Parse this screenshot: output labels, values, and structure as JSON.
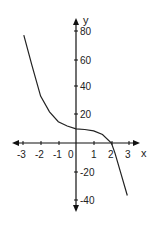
{
  "chart_data": {
    "type": "line",
    "title": "",
    "xlabel": "x",
    "ylabel": "y",
    "xlim": [
      -3.5,
      3.5
    ],
    "ylim": [
      -50,
      90
    ],
    "grid": false,
    "x_ticks": [
      "-3",
      "-2",
      "-1",
      "0",
      "1",
      "2",
      "3"
    ],
    "y_ticks": [
      "80",
      "60",
      "40",
      "20",
      "-20",
      "-40"
    ],
    "series": [
      {
        "name": "f(x)",
        "x": [
          -2.95,
          -2.5,
          -2.0,
          -1.5,
          -1.0,
          -0.5,
          0.0,
          0.5,
          1.0,
          1.5,
          2.0,
          2.2,
          2.5,
          2.9
        ],
        "y": [
          76,
          55,
          33,
          22,
          15,
          12,
          10,
          9.5,
          8.5,
          6,
          0,
          -7,
          -20,
          -37
        ]
      }
    ]
  },
  "labels": {
    "x_axis": "x",
    "y_axis": "y",
    "x_ticks": [
      "-3",
      "-2",
      "-1",
      "0",
      "1",
      "2",
      "3"
    ],
    "y_ticks": [
      "80",
      "60",
      "40",
      "20",
      "-20",
      "-40"
    ]
  },
  "colors": {
    "axis": "#111111",
    "curve": "#222222",
    "text": "#222222"
  }
}
